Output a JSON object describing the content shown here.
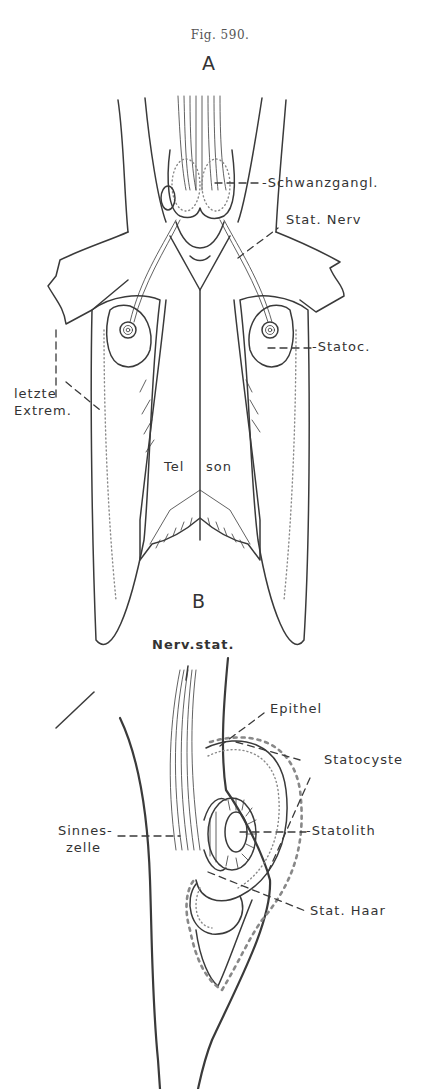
{
  "figure": {
    "caption": "Fig. 590.",
    "panels": [
      {
        "letter": "A",
        "labels": {
          "schwanzgangl": "-Schwanzgangl.",
          "stat_nerv": "Stat. Nerv",
          "statoc": "-Statoc.",
          "letzte": "letzte",
          "extrem": "Extrem.",
          "tel": "Tel",
          "son": "son"
        }
      },
      {
        "letter": "B",
        "labels": {
          "nerv_stat": "Nerv.stat.",
          "epithel": "Epithel",
          "statocyste": "Statocyste",
          "sinnes": "Sinnes-",
          "zelle": "zelle",
          "statolith": "-Statolith",
          "stat_haar": "Stat. Haar"
        }
      }
    ]
  }
}
